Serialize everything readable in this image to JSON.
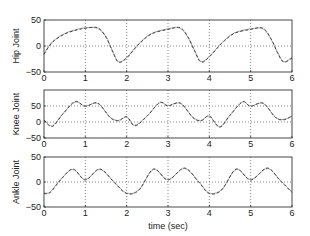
{
  "chart_data": [
    {
      "type": "line",
      "title": "",
      "xlabel": "",
      "ylabel": "Hip Joint",
      "xlim": [
        0,
        6
      ],
      "ylim": [
        -50,
        50
      ],
      "xticks": [
        0,
        1,
        2,
        3,
        4,
        5,
        6
      ],
      "yticks": [
        -50,
        0,
        50
      ],
      "ytick_labels": [
        "−50",
        "0",
        "50"
      ],
      "grid": "dotted",
      "series": [
        {
          "name": "measured",
          "style": "solid-light",
          "x": [
            0,
            0.2,
            0.5,
            0.8,
            1.0,
            1.3,
            1.5,
            1.65,
            1.8,
            2.0,
            2.3,
            2.6,
            3.0,
            3.3,
            3.5,
            3.65,
            3.8,
            4.0,
            4.3,
            4.6,
            5.0,
            5.3,
            5.5,
            5.65,
            5.8,
            6.0
          ],
          "values": [
            -15,
            8,
            24,
            32,
            35,
            34,
            18,
            -8,
            -30,
            -22,
            5,
            24,
            33,
            34,
            14,
            -10,
            -30,
            -20,
            6,
            25,
            33,
            33,
            12,
            -12,
            -30,
            -22
          ]
        },
        {
          "name": "model",
          "style": "dashed",
          "x": [
            0,
            0.2,
            0.5,
            0.8,
            1.0,
            1.3,
            1.5,
            1.65,
            1.8,
            2.0,
            2.3,
            2.6,
            3.0,
            3.3,
            3.5,
            3.65,
            3.8,
            4.0,
            4.3,
            4.6,
            5.0,
            5.3,
            5.5,
            5.65,
            5.8,
            6.0
          ],
          "values": [
            -16,
            7,
            23,
            31,
            34,
            35,
            17,
            -9,
            -31,
            -23,
            4,
            23,
            32,
            35,
            15,
            -11,
            -31,
            -21,
            5,
            24,
            32,
            34,
            13,
            -13,
            -31,
            -23
          ]
        }
      ]
    },
    {
      "type": "line",
      "title": "",
      "xlabel": "",
      "ylabel": "Knee Joint",
      "xlim": [
        0,
        6
      ],
      "ylim": [
        -50,
        100
      ],
      "xticks": [
        0,
        1,
        2,
        3,
        4,
        5,
        6
      ],
      "yticks": [
        -50,
        0,
        50
      ],
      "ytick_labels": [
        "−50",
        "0",
        "50"
      ],
      "grid": "dotted",
      "series": [
        {
          "name": "measured",
          "style": "solid-light",
          "x": [
            0,
            0.2,
            0.45,
            0.75,
            1.0,
            1.3,
            1.6,
            1.8,
            2.0,
            2.2,
            2.5,
            2.8,
            3.0,
            3.3,
            3.6,
            3.8,
            4.0,
            4.25,
            4.5,
            4.8,
            5.0,
            5.3,
            5.6,
            5.8,
            6.0
          ],
          "values": [
            5,
            -12,
            25,
            62,
            50,
            58,
            15,
            5,
            15,
            -10,
            20,
            60,
            52,
            58,
            15,
            5,
            18,
            -15,
            22,
            62,
            50,
            58,
            15,
            8,
            18
          ]
        },
        {
          "name": "model",
          "style": "dashed",
          "x": [
            0,
            0.2,
            0.45,
            0.75,
            1.0,
            1.3,
            1.6,
            1.8,
            2.0,
            2.2,
            2.5,
            2.8,
            3.0,
            3.3,
            3.6,
            3.8,
            4.0,
            4.25,
            4.5,
            4.8,
            5.0,
            5.3,
            5.6,
            5.8,
            6.0
          ],
          "values": [
            6,
            -14,
            24,
            64,
            49,
            59,
            14,
            4,
            17,
            -12,
            19,
            61,
            50,
            59,
            14,
            4,
            19,
            -16,
            21,
            63,
            49,
            59,
            14,
            7,
            19
          ]
        }
      ]
    },
    {
      "type": "line",
      "title": "",
      "xlabel": "time (sec)",
      "ylabel": "Ankle Joint",
      "xlim": [
        0,
        6
      ],
      "ylim": [
        -50,
        50
      ],
      "xticks": [
        0,
        1,
        2,
        3,
        4,
        5,
        6
      ],
      "yticks": [
        -50,
        0,
        50
      ],
      "ytick_labels": [
        "−50",
        "0",
        "50"
      ],
      "grid": "dotted",
      "series": [
        {
          "name": "measured",
          "style": "solid-light",
          "x": [
            0,
            0.15,
            0.4,
            0.7,
            1.0,
            1.35,
            1.7,
            2.0,
            2.3,
            2.65,
            3.0,
            3.4,
            3.75,
            4.0,
            4.3,
            4.65,
            5.0,
            5.4,
            5.7,
            6.0
          ],
          "values": [
            -22,
            -20,
            5,
            25,
            5,
            25,
            0,
            -22,
            -15,
            25,
            5,
            27,
            0,
            -22,
            -15,
            25,
            5,
            27,
            5,
            -20
          ]
        },
        {
          "name": "model",
          "style": "dashed",
          "x": [
            0,
            0.15,
            0.4,
            0.7,
            1.0,
            1.35,
            1.7,
            2.0,
            2.3,
            2.65,
            3.0,
            3.4,
            3.75,
            4.0,
            4.3,
            4.65,
            5.0,
            5.4,
            5.7,
            6.0
          ],
          "values": [
            -23,
            -21,
            4,
            26,
            4,
            26,
            -1,
            -23,
            -16,
            26,
            4,
            28,
            -1,
            -23,
            -16,
            26,
            4,
            28,
            4,
            -21
          ]
        }
      ]
    }
  ],
  "labels": {
    "hip_ylabel": "Hip Joint",
    "knee_ylabel": "Knee Joint",
    "ankle_ylabel": "Ankle Joint",
    "xlabel": "time (sec)"
  },
  "colors": {
    "axis": "#333333",
    "grid": "#555555",
    "measured": "#9a9a9a",
    "model": "#444444"
  }
}
